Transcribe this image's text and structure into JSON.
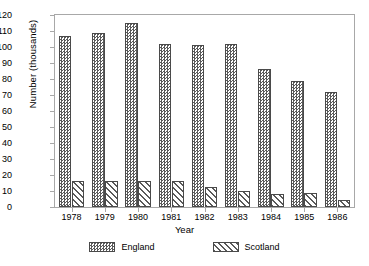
{
  "chart_data": {
    "type": "bar",
    "title": "",
    "xlabel": "Year",
    "ylabel": "Number (thousands)",
    "categories": [
      "1978",
      "1979",
      "1980",
      "1981",
      "1982",
      "1983",
      "1984",
      "1985",
      "1986"
    ],
    "series": [
      {
        "name": "England",
        "pattern": "checkerboard",
        "color": "#5a5a5a",
        "values": [
          107,
          109,
          115,
          102,
          101,
          102,
          86,
          79,
          72
        ]
      },
      {
        "name": "Scotland",
        "pattern": "diagonal-hatch",
        "color": "#5a5a5a",
        "values": [
          16,
          16,
          16,
          16,
          12.5,
          10,
          8,
          9,
          4.5
        ]
      }
    ],
    "ylim": [
      0,
      120
    ],
    "yticks": [
      "0",
      "10",
      "20",
      "30",
      "40",
      "50",
      "60",
      "70",
      "80",
      "90",
      "100",
      "110",
      "120"
    ],
    "ytick_step": 10,
    "grid": false,
    "legend_position": "bottom",
    "frame_color": "#a8a8a8",
    "background": "#ffffff"
  },
  "legend": {
    "items": [
      {
        "label": "England"
      },
      {
        "label": "Scotland"
      }
    ]
  }
}
